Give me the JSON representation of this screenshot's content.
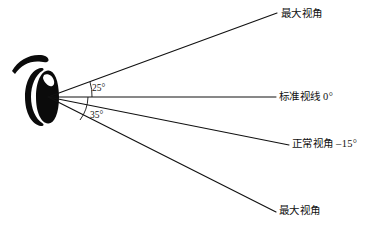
{
  "figure": {
    "title": "",
    "background_color": "#ffffff",
    "line_color": "#111111"
  },
  "eye": {
    "icon_name": "eye-glyph",
    "origin_x": 48,
    "origin_y": 97
  },
  "angles": {
    "upper": "25°",
    "lower": "35°"
  },
  "labels": {
    "max_upper": "最大视角",
    "standard": "标准视线 0°",
    "normal": "正常视角 –15°",
    "max_lower": "最大视角"
  },
  "rays": [
    {
      "name": "max-upper-ray",
      "label": "最大视角",
      "angle_deg": 25,
      "x1": 48,
      "y1": 97,
      "x2": 277,
      "y2": 13
    },
    {
      "name": "standard-ray",
      "label": "标准视线 0°",
      "angle_deg": 0,
      "x1": 48,
      "y1": 97,
      "x2": 276,
      "y2": 97
    },
    {
      "name": "normal-ray",
      "label": "正常视角 –15°",
      "angle_deg": -15,
      "x1": 48,
      "y1": 97,
      "x2": 289,
      "y2": 145
    },
    {
      "name": "max-lower-ray",
      "label": "最大视角",
      "angle_deg": -35,
      "x1": 48,
      "y1": 97,
      "x2": 276,
      "y2": 212
    }
  ]
}
